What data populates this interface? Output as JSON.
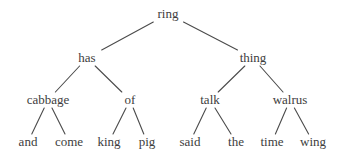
{
  "colors": {
    "text": "#3d3d3d",
    "line": "#4b4b4b",
    "background": "#ffffff"
  },
  "tree": {
    "type": "binary-tree-diagram",
    "root": {
      "label": "ring",
      "children": [
        {
          "label": "has",
          "children": [
            {
              "label": "cabbage",
              "children": [
                {
                  "label": "and"
                },
                {
                  "label": "come"
                }
              ]
            },
            {
              "label": "of",
              "children": [
                {
                  "label": "king"
                },
                {
                  "label": "pig"
                }
              ]
            }
          ]
        },
        {
          "label": "thing",
          "children": [
            {
              "label": "talk",
              "children": [
                {
                  "label": "said"
                },
                {
                  "label": "the"
                }
              ]
            },
            {
              "label": "walrus",
              "children": [
                {
                  "label": "time"
                },
                {
                  "label": "wing"
                }
              ]
            }
          ]
        }
      ]
    }
  }
}
